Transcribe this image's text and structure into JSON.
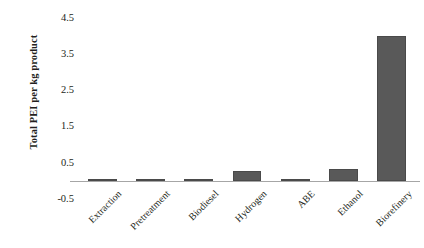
{
  "chart_data": {
    "type": "bar",
    "title": "",
    "xlabel": "",
    "ylabel": "Total PEI per kg product",
    "categories": [
      "Extraction",
      "Pretreatment",
      "Biodiesel",
      "Hydrogen",
      "ABE",
      "Ethanol",
      "Biorefinery"
    ],
    "values": [
      0.005,
      0.005,
      0.01,
      0.28,
      0.04,
      0.33,
      4.0
    ],
    "ylim": [
      -0.5,
      4.5
    ],
    "ytick_labels": [
      "4.5",
      "3.5",
      "2.5",
      "1.5",
      "0.5",
      "-0.5"
    ],
    "ytick_values": [
      4.5,
      3.5,
      2.5,
      1.5,
      0.5,
      -0.5
    ],
    "grid": false,
    "legend": "none",
    "bar_color": "#595959",
    "axis_color": "#a6a6a6",
    "text_color": "#231f20"
  }
}
